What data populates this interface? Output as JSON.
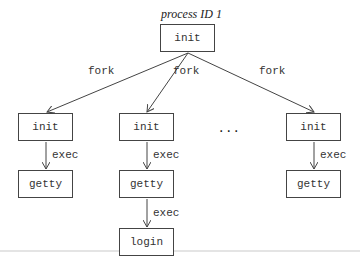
{
  "diagram": {
    "title": "process ID 1",
    "root": {
      "label": "init"
    },
    "edges": {
      "fork_label": "fork",
      "exec_label": "exec"
    },
    "columns": [
      {
        "child": "init",
        "exec_target": "getty"
      },
      {
        "child": "init",
        "exec_target": "getty",
        "second_exec_target": "login"
      },
      {
        "child": "init",
        "exec_target": "getty"
      }
    ],
    "ellipsis": "...",
    "colors": {
      "line": "#444444",
      "text": "#333333",
      "background": "#ffffff"
    }
  }
}
